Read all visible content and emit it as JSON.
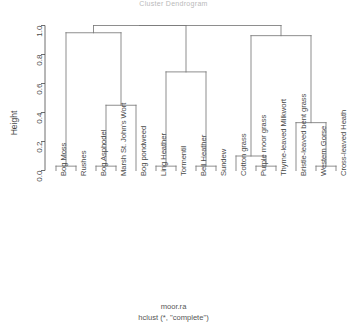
{
  "plot": {
    "title": "Cluster Dendrogram",
    "xlabel_line1": "moor.ra",
    "xlabel_line2": "hclust (*, \"complete\")",
    "ylabel": "Height",
    "axis_color": "#4a4a4a",
    "line_color": "#777777"
  },
  "chart_data": {
    "type": "dendrogram",
    "title": "Cluster Dendrogram",
    "xlabel": "moor.ra\nhclust (*, \"complete\")",
    "ylabel": "Height",
    "ylim": [
      0.0,
      1.0
    ],
    "yticks": [
      "0.0",
      "0.2",
      "0.4",
      "0.6",
      "0.8",
      "1.0"
    ],
    "ytick_values": [
      0.0,
      0.2,
      0.4,
      0.6,
      0.8,
      1.0
    ],
    "grid": false,
    "legend": "none",
    "method": "complete",
    "dataset": "moor.ra",
    "n_leaves": 15,
    "leaves": [
      "Bog Moss",
      "Rushes",
      "Bog Asphodel",
      "Marsh St. John's Wort",
      "Bog pondweed",
      "Ling Heather",
      "Tormentil",
      "Bell Heather",
      "Sundew",
      "Cotton grass",
      "Purple moor grass",
      "Thyme-leaved Milkwort",
      "Bristle-leaved bent grass",
      "Western Gorse",
      "Cross-leaved Heath"
    ],
    "merges": [
      {
        "id": "m1",
        "left": "Bog Moss",
        "right": "Rushes",
        "height": 0.03
      },
      {
        "id": "m2",
        "left": "Bog Asphodel",
        "right": "Marsh St. John's Wort",
        "height": 0.03
      },
      {
        "id": "m3",
        "left": "m2",
        "right": "Bog pondweed",
        "height": 0.45
      },
      {
        "id": "m4",
        "left": "m1",
        "right": "m3",
        "height": 0.95
      },
      {
        "id": "m5",
        "left": "Ling Heather",
        "right": "Tormentil",
        "height": 0.03
      },
      {
        "id": "m6",
        "left": "Bell Heather",
        "right": "Sundew",
        "height": 0.03
      },
      {
        "id": "m7",
        "left": "m5",
        "right": "m6",
        "height": 0.68
      },
      {
        "id": "m8",
        "left": "Purple moor grass",
        "right": "Thyme-leaved Milkwort",
        "height": 0.03
      },
      {
        "id": "m9",
        "left": "Cotton grass",
        "right": "m8",
        "height": 0.1
      },
      {
        "id": "m10",
        "left": "Western Gorse",
        "right": "Cross-leaved Heath",
        "height": 0.03
      },
      {
        "id": "m11",
        "left": "Bristle-leaved bent grass",
        "right": "m10",
        "height": 0.33
      },
      {
        "id": "m12",
        "left": "m9",
        "right": "m11",
        "height": 0.93
      },
      {
        "id": "m13",
        "left": "m4",
        "right": "m7",
        "height": 1.0
      },
      {
        "id": "m14",
        "left": "m13",
        "right": "m12",
        "height": 1.0
      }
    ]
  }
}
